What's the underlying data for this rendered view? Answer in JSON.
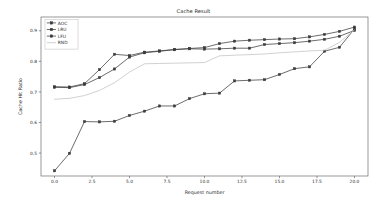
{
  "chart_data": {
    "type": "line",
    "title": "Cache Result",
    "xlabel": "Request number",
    "ylabel": "Cache Hit Ratio",
    "xlim": [
      -0.9,
      20.9
    ],
    "ylim": [
      0.425,
      0.945
    ],
    "xticks": [
      "0.0",
      "2.5",
      "5.0",
      "7.5",
      "10.0",
      "12.5",
      "15.0",
      "17.5",
      "20.0"
    ],
    "xtick_values": [
      0.0,
      2.5,
      5.0,
      7.5,
      10.0,
      12.5,
      15.0,
      17.5,
      20.0
    ],
    "yticks": [
      "0.5",
      "0.6",
      "0.7",
      "0.8",
      "0.9"
    ],
    "ytick_values": [
      0.5,
      0.6,
      0.7,
      0.8,
      0.9
    ],
    "grid": false,
    "legend_position": "upper left",
    "x": [
      0,
      1,
      2,
      3,
      4,
      5,
      6,
      7,
      8,
      9,
      10,
      11,
      12,
      13,
      14,
      15,
      16,
      17,
      18,
      19,
      20
    ],
    "series": [
      {
        "name": "AOC",
        "color": "#3b3b3b",
        "marker": "square",
        "linestyle": "solid",
        "values": [
          0.717,
          0.716,
          0.727,
          0.773,
          0.823,
          0.819,
          0.83,
          0.834,
          0.839,
          0.842,
          0.845,
          0.858,
          0.866,
          0.869,
          0.871,
          0.873,
          0.874,
          0.88,
          0.888,
          0.898,
          0.912
        ]
      },
      {
        "name": "LRU",
        "color": "#3b3b3b",
        "marker": "square",
        "linestyle": "solid",
        "values": [
          0.715,
          0.714,
          0.724,
          0.747,
          0.775,
          0.814,
          0.828,
          0.833,
          0.838,
          0.841,
          0.84,
          0.841,
          0.843,
          0.843,
          0.855,
          0.858,
          0.861,
          0.866,
          0.872,
          0.882,
          0.901
        ]
      },
      {
        "name": "LFU",
        "color": "#3b3b3b",
        "marker": "square",
        "linestyle": "solid",
        "values": [
          0.442,
          0.499,
          0.603,
          0.602,
          0.604,
          0.623,
          0.637,
          0.654,
          0.654,
          0.678,
          0.694,
          0.696,
          0.736,
          0.738,
          0.74,
          0.757,
          0.776,
          0.782,
          0.833,
          0.846,
          0.906
        ]
      },
      {
        "name": "RND",
        "color": "#c2c2c2",
        "marker": "none",
        "linestyle": "solid",
        "values": [
          0.676,
          0.679,
          0.688,
          0.705,
          0.73,
          0.765,
          0.792,
          0.793,
          0.794,
          0.795,
          0.796,
          0.818,
          0.82,
          0.822,
          0.824,
          0.828,
          0.831,
          0.834,
          0.836,
          0.862,
          0.903
        ]
      }
    ]
  },
  "legend": {
    "entries": [
      {
        "label": "AOC"
      },
      {
        "label": "LRU"
      },
      {
        "label": "LFU"
      },
      {
        "label": "RND"
      }
    ]
  }
}
